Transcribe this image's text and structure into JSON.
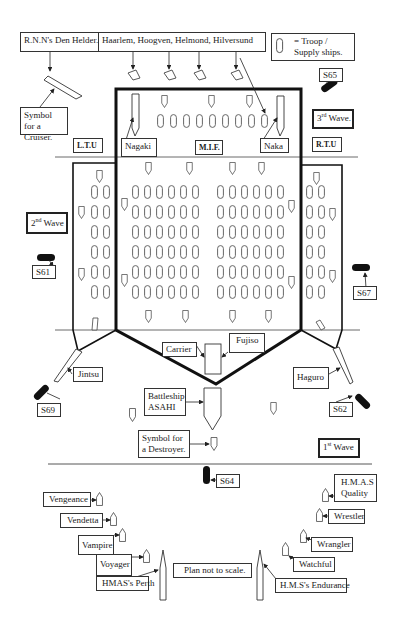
{
  "diagram": {
    "type": "naval-formation-plan",
    "note": "Plan not to scale."
  },
  "labels": {
    "rnn_den_helder": "R.N.N's Den Helder.",
    "dutch_ships": "Haarlem,  Hoogven,  Helmond, Hilversund",
    "legend_troop": "= Troop / Supply ships.",
    "cruiser_symbol": "Symbol for a Cruiser.",
    "ltu": "L.T.U",
    "mif": "M.I.F.",
    "rtu": "R.T.U",
    "nagaki": "Nagaki",
    "naka": "Naka",
    "third_wave": "3rd Wave.",
    "second_wave": "2nd Wave",
    "first_wave": "1st Wave",
    "s65": "S65",
    "s61": "S61",
    "s67": "S67",
    "s69": "S69",
    "s62": "S62",
    "s64": "S64",
    "carrier": "Carrier",
    "fujiso": "Fujiso",
    "jintsu": "Jintsu",
    "haguro": "Haguro",
    "battleship": "Battleship ASAHI",
    "destroyer_symbol": "Symbol for a Destroyer.",
    "vengeance": "Vengeance",
    "vendetta": "Vendetta",
    "vampire": "Vampire",
    "voyager": "Voyager",
    "perth": "HMAS's Perth",
    "plan_note": "Plan not to scale.",
    "endurance": "H.M.S's Endurance",
    "watchful": "Watchful",
    "wrangler": "Wrangler",
    "wrestler": "Wrestler",
    "quality": "H.M.A.S Quality"
  },
  "formation": {
    "center_rows": 6,
    "center_cols_per_block": 6,
    "center_blocks": 2,
    "top_row_troopships": 9,
    "flank_rows": 6
  }
}
